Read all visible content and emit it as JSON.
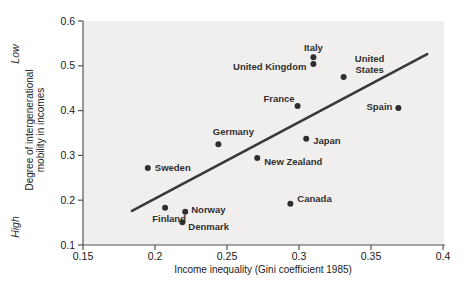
{
  "figure": {
    "low_label": "Low",
    "high_label": "High",
    "y_axis_title_line1": "Degree of intergenerational",
    "y_axis_title_line2": "mobility in incomes",
    "x_axis_title": "Income inequality (Gini coefficient 1985)"
  },
  "colors": {
    "page_background": "#ffffff",
    "plot_background": "#f0efee",
    "axis": "#555555",
    "tick_text": "#1a1a1a",
    "label_text": "#303030",
    "point": "#2e2e2e",
    "trend_line": "#393939"
  },
  "chart_data": {
    "type": "scatter",
    "title": "",
    "xlabel": "Income inequality (Gini coefficient 1985)",
    "ylabel_lines": [
      "Degree of intergenerational",
      "mobility in incomes"
    ],
    "y_axis_top_annotation": "Low",
    "y_axis_bottom_annotation": "High",
    "xlim": [
      0.15,
      0.4
    ],
    "ylim": [
      0.1,
      0.6
    ],
    "x_tick_values": [
      0.15,
      0.2,
      0.25,
      0.3,
      0.35,
      0.4
    ],
    "x_tick_labels": [
      "0.15",
      "0.2",
      "0.25",
      "0.3",
      "0.35",
      "0.4"
    ],
    "y_tick_values": [
      0.1,
      0.2,
      0.3,
      0.4,
      0.5,
      0.6
    ],
    "y_tick_labels": [
      "0.1",
      "0.2",
      "0.3",
      "0.4",
      "0.5",
      "0.6"
    ],
    "grid": false,
    "legend": false,
    "points": [
      {
        "country": "Sweden",
        "x": 0.195,
        "y": 0.272,
        "label_anchor": "start",
        "label_dx": 7,
        "label_dy": 3,
        "label_lines": [
          "Sweden"
        ]
      },
      {
        "country": "Finland",
        "x": 0.207,
        "y": 0.183,
        "label_anchor": "middle",
        "label_dx": 4,
        "label_dy": 14,
        "label_lines": [
          "Finland"
        ]
      },
      {
        "country": "Norway",
        "x": 0.221,
        "y": 0.174,
        "label_anchor": "start",
        "label_dx": 6,
        "label_dy": 1,
        "label_lines": [
          "Norway"
        ]
      },
      {
        "country": "Denmark",
        "x": 0.219,
        "y": 0.151,
        "label_anchor": "start",
        "label_dx": 6,
        "label_dy": 8,
        "label_lines": [
          "Denmark"
        ]
      },
      {
        "country": "Germany",
        "x": 0.244,
        "y": 0.325,
        "label_anchor": "middle",
        "label_dx": 15,
        "label_dy": -9,
        "label_lines": [
          "Germany"
        ]
      },
      {
        "country": "New Zealand",
        "x": 0.271,
        "y": 0.294,
        "label_anchor": "start",
        "label_dx": 7,
        "label_dy": 7,
        "label_lines": [
          "New Zealand"
        ]
      },
      {
        "country": "Canada",
        "x": 0.294,
        "y": 0.192,
        "label_anchor": "start",
        "label_dx": 7,
        "label_dy": -2,
        "label_lines": [
          "Canada"
        ]
      },
      {
        "country": "France",
        "x": 0.299,
        "y": 0.41,
        "label_anchor": "end",
        "label_dx": -3,
        "label_dy": -4,
        "label_lines": [
          "France"
        ]
      },
      {
        "country": "Japan",
        "x": 0.305,
        "y": 0.337,
        "label_anchor": "start",
        "label_dx": 7,
        "label_dy": 5,
        "label_lines": [
          "Japan"
        ]
      },
      {
        "country": "Italy",
        "x": 0.31,
        "y": 0.519,
        "label_anchor": "middle",
        "label_dx": 0,
        "label_dy": -6,
        "label_lines": [
          "Italy"
        ]
      },
      {
        "country": "United Kingdom",
        "x": 0.31,
        "y": 0.504,
        "label_anchor": "end",
        "label_dx": -7,
        "label_dy": 6,
        "label_lines": [
          "United Kingdom"
        ]
      },
      {
        "country": "United States",
        "x": 0.331,
        "y": 0.475,
        "label_anchor": "middle",
        "label_dx": 26,
        "label_dy": -15,
        "label_lines": [
          "United",
          "States"
        ]
      },
      {
        "country": "Spain",
        "x": 0.369,
        "y": 0.406,
        "label_anchor": "end",
        "label_dx": -6,
        "label_dy": 2,
        "label_lines": [
          "Spain"
        ]
      }
    ],
    "trend_line": {
      "x1": 0.184,
      "y1": 0.176,
      "x2": 0.389,
      "y2": 0.526
    }
  }
}
